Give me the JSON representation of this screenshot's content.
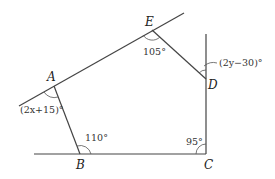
{
  "diagram": {
    "type": "geometry-pentagon-exterior-angles",
    "points": {
      "A": {
        "label": "A",
        "x": 54,
        "y": 86
      },
      "B": {
        "label": "B",
        "x": 80,
        "y": 154
      },
      "C": {
        "label": "C",
        "x": 206,
        "y": 154
      },
      "D": {
        "label": "D",
        "x": 206,
        "y": 79
      },
      "E": {
        "label": "E",
        "x": 152,
        "y": 30
      }
    },
    "angles": {
      "A": "(2x+15)°",
      "B": "110°",
      "C": "95°",
      "D": "(2y−30)°",
      "E": "105°"
    },
    "colors": {
      "line": "#444444",
      "text": "#222222"
    }
  }
}
